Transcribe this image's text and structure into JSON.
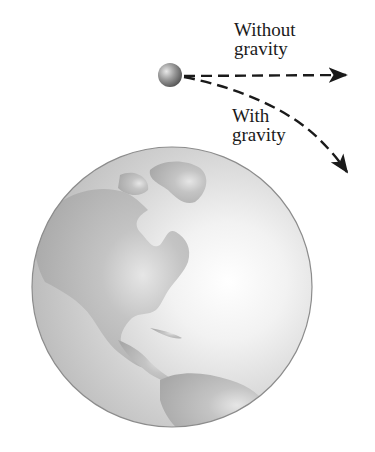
{
  "diagram": {
    "labels": {
      "without_gravity": {
        "line1": "Without",
        "line2": "gravity"
      },
      "with_gravity": {
        "line1": "With",
        "line2": "gravity"
      }
    },
    "objects": {
      "projectile": "ball-icon",
      "planet": "earth-globe-icon"
    },
    "paths": {
      "without_gravity": "straight dashed arrow",
      "with_gravity": "curved dashed arrow"
    },
    "colors": {
      "ink": "#1a1a1a",
      "land": "#b3b3b3",
      "ocean": "#d6d6d6",
      "highlight": "#ffffff",
      "globe_edge": "#8c8c8c",
      "ball": "#8a8a8a"
    }
  }
}
